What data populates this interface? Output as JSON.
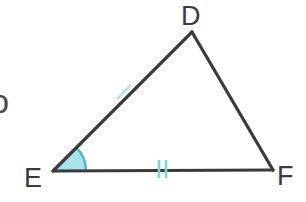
{
  "figure": {
    "name": "triangle-def",
    "background_color": "#ffffff",
    "stroke_color": "#3a3a3a",
    "stroke_width": 3,
    "mark_color": "#7ed4e0",
    "angle_fill_color": "#a9e2ec",
    "angle_arc_color": "#4fb6c6",
    "vertices": [
      {
        "label": "D",
        "x": 192,
        "y": 32
      },
      {
        "label": "E",
        "x": 53,
        "y": 171
      },
      {
        "label": "F",
        "x": 273,
        "y": 170
      }
    ],
    "sides": [
      {
        "name": "ED",
        "from": "E",
        "to": "D",
        "ticks": 1
      },
      {
        "name": "DF",
        "from": "D",
        "to": "F",
        "ticks": 0
      },
      {
        "name": "EF",
        "from": "E",
        "to": "F",
        "ticks": 2
      }
    ],
    "angle_marks": [
      {
        "at": "E",
        "style": "filled-sector",
        "radius": 33
      }
    ],
    "labels": {
      "d": "D",
      "e": "E",
      "f": "F"
    },
    "stray_glyph": "ɔ"
  }
}
